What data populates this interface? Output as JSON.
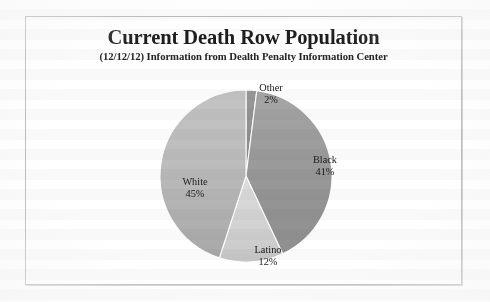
{
  "document": {
    "kind": "scanned-figure",
    "background_color": "#ffffff",
    "frame_color": "#b9b9b9"
  },
  "header": {
    "title": "Current Death Row Population",
    "subtitle": "(12/12/12) Information from Dealth Penalty Information Center"
  },
  "labels": {
    "other": {
      "name": "Other",
      "value": "2%"
    },
    "black": {
      "name": "Black",
      "value": "41%"
    },
    "white": {
      "name": "White",
      "value": "45%"
    },
    "latino": {
      "name": "Latino",
      "value": "12%"
    }
  },
  "chart_data": {
    "type": "pie",
    "title": "Current Death Row Population",
    "subtitle": "(12/12/12) Information from Dealth Penalty Information Center",
    "categories": [
      "Other",
      "Black",
      "Latino",
      "White"
    ],
    "values": [
      2,
      41,
      12,
      45
    ],
    "value_unit": "percent",
    "value_labels": [
      "2%",
      "41%",
      "12%",
      "45%"
    ],
    "start_angle_deg": 0,
    "direction": "clockwise",
    "legend": "none",
    "labels_position": "inside-and-outside",
    "colors": {
      "Other": "#8e8e8e",
      "Black": "#9d9d9d",
      "Latino": "#d3d3d3",
      "White": "#bcbcbc"
    },
    "geometry": {
      "center_x": 246,
      "center_y": 176,
      "radius": 86
    }
  }
}
